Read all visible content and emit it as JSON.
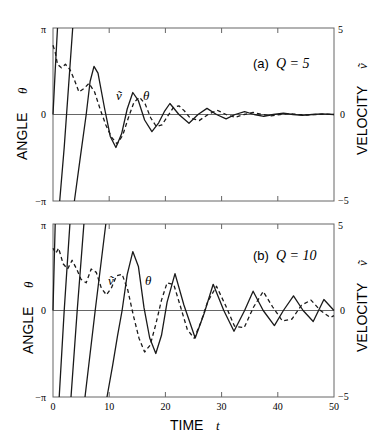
{
  "chart_data": [
    {
      "type": "line",
      "panel_label": "(a)",
      "param_label": "Q = 5",
      "Q": 5,
      "xlabel": "TIME",
      "xlabel_symbol": "t",
      "ylabel_left": "ANGLE",
      "ylabel_left_symbol": "θ",
      "ylabel_right": "VELOCITY",
      "ylabel_right_symbol": "ṽ",
      "xlim": [
        0,
        50
      ],
      "ylim_left": [
        -3.14159,
        3.14159
      ],
      "ylim_right": [
        -5,
        5
      ],
      "yticks_left": [
        "π",
        "0",
        "−π"
      ],
      "yticks_right": [
        "5",
        "0",
        "−5"
      ],
      "xticks": [
        0,
        10,
        20,
        30,
        40,
        50
      ],
      "xtick_labels_shown": false,
      "grid": false,
      "zero_line": true,
      "annotations": [
        {
          "text": "ṽ",
          "t": 12.0,
          "y": 0.95
        },
        {
          "text": "θ",
          "t": 16.5,
          "y": 0.95
        }
      ],
      "series": [
        {
          "name": "θ (angle, wrapped to [−π, π])",
          "style": "solid",
          "segments": [
            {
              "t": [
                0,
                0.4,
                0.8
              ],
              "y": [
                0,
                1.6,
                3.14
              ]
            },
            {
              "t": [
                1.2,
                2.0,
                2.8,
                3.5
              ],
              "y": [
                -3.14,
                -1.2,
                1.1,
                3.14
              ]
            },
            {
              "t": [
                3.8,
                4.9,
                5.9,
                6.6,
                7.3,
                8.0,
                9.2,
                10.2,
                11.2,
                12.2,
                13.2,
                14.2,
                15.2,
                16.3,
                17.6,
                18.8,
                19.8,
                20.8,
                22.4,
                24.2,
                25.8,
                27.4,
                29.1,
                30.8,
                32.4,
                34.1,
                35.8,
                37.5,
                39.2,
                41.0,
                42.7,
                44.4,
                46.1,
                47.8,
                50.0
              ],
              "y": [
                -3.14,
                -1.5,
                0,
                1.2,
                1.75,
                1.5,
                0.2,
                -0.8,
                -1.2,
                -0.7,
                0.2,
                0.8,
                0.5,
                -0.2,
                -0.62,
                -0.3,
                0.1,
                0.4,
                0.0,
                -0.32,
                0.0,
                0.22,
                0.0,
                -0.16,
                0.0,
                0.1,
                0.0,
                -0.07,
                0.0,
                0.05,
                0.0,
                -0.03,
                0.0,
                0.02,
                0.0
              ]
            }
          ]
        },
        {
          "name": "ṽ (velocity)",
          "style": "dashed",
          "t": [
            0,
            0.4,
            0.8,
            1.5,
            2.2,
            3.0,
            3.8,
            4.6,
            5.5,
            6.4,
            7.4,
            8.4,
            9.4,
            10.4,
            11.4,
            12.4,
            13.4,
            14.4,
            15.4,
            16.4,
            17.4,
            18.4,
            19.4,
            20.4,
            21.4,
            22.4,
            23.4,
            24.4,
            26.0,
            27.6,
            29.2,
            30.8,
            32.4,
            34.0,
            35.6,
            37.2,
            38.8,
            40.4,
            42.0,
            43.6,
            45.2,
            46.8,
            48.4,
            50.0
          ],
          "y": [
            4.0,
            3.6,
            2.9,
            2.7,
            2.9,
            2.6,
            2.0,
            1.3,
            1.5,
            1.8,
            1.3,
            0.3,
            -0.6,
            -1.3,
            -1.7,
            -1.2,
            -0.2,
            0.7,
            1.0,
            0.6,
            -0.2,
            -0.7,
            -0.6,
            -0.1,
            0.4,
            0.5,
            0.2,
            -0.2,
            -0.35,
            0.0,
            0.25,
            0.0,
            -0.17,
            0.0,
            0.12,
            0.0,
            -0.08,
            0.0,
            0.05,
            0.0,
            -0.03,
            0.0,
            0.02,
            0.0
          ]
        }
      ]
    },
    {
      "type": "line",
      "panel_label": "(b)",
      "param_label": "Q = 10",
      "Q": 10,
      "xlabel": "TIME",
      "xlabel_symbol": "t",
      "ylabel_left": "ANGLE",
      "ylabel_left_symbol": "θ",
      "ylabel_right": "VELOCITY",
      "ylabel_right_symbol": "ṽ",
      "xlim": [
        0,
        50
      ],
      "ylim_left": [
        -3.14159,
        3.14159
      ],
      "ylim_right": [
        -5,
        5
      ],
      "yticks_left": [
        "π",
        "0",
        "−π"
      ],
      "yticks_right": [
        "5",
        "0",
        "−5"
      ],
      "xticks": [
        0,
        10,
        20,
        30,
        40,
        50
      ],
      "xtick_labels_shown": true,
      "grid": false,
      "zero_line": true,
      "annotations": [
        {
          "text": "ṽ",
          "t": 10.3,
          "y": 1.6
        },
        {
          "text": "θ",
          "t": 16.4,
          "y": 1.6
        }
      ],
      "series": [
        {
          "name": "θ (angle, wrapped to [−π, π])",
          "style": "solid",
          "segments": [
            {
              "t": [
                0,
                0.2,
                0.4
              ],
              "y": [
                0,
                1.6,
                3.14
              ]
            },
            {
              "t": [
                1.1,
                2.0,
                3.0
              ],
              "y": [
                -3.14,
                0,
                3.14
              ]
            },
            {
              "t": [
                3.2,
                4.3,
                5.5
              ],
              "y": [
                -3.14,
                0,
                3.14
              ]
            },
            {
              "t": [
                5.7,
                7.5,
                9.4
              ],
              "y": [
                -3.14,
                0,
                3.14
              ]
            },
            {
              "t": [
                9.6,
                10.6,
                11.5,
                12.3,
                13.2,
                14.2,
                15.2,
                16.2,
                17.2,
                18.3,
                19.3,
                20.3,
                21.7,
                23.3,
                25.3,
                26.9,
                28.5,
                30.4,
                32.2,
                34.1,
                35.6,
                37.4,
                39.4,
                41.0,
                42.8,
                44.5,
                46.3,
                48.2,
                50.0
              ],
              "y": [
                -3.14,
                -2.0,
                -0.9,
                0.0,
                1.3,
                2.14,
                1.6,
                0.1,
                -1.0,
                -1.56,
                -0.9,
                0.3,
                1.34,
                0.2,
                -1.0,
                -0.1,
                0.95,
                0.0,
                -0.75,
                0.0,
                0.7,
                0.0,
                -0.55,
                0.0,
                0.53,
                0.0,
                -0.4,
                0.4,
                0.0
              ]
            }
          ]
        },
        {
          "name": "ṽ (velocity)",
          "style": "dashed",
          "t": [
            0,
            0.5,
            1.0,
            1.8,
            2.6,
            3.4,
            4.2,
            5.0,
            5.9,
            6.8,
            7.7,
            8.6,
            9.5,
            10.4,
            11.3,
            12.3,
            13.3,
            14.3,
            15.3,
            16.3,
            17.3,
            18.3,
            19.3,
            20.3,
            21.5,
            22.7,
            23.9,
            25.1,
            26.3,
            27.5,
            29.1,
            30.7,
            32.3,
            34.0,
            35.7,
            37.4,
            39.1,
            40.8,
            42.5,
            44.2,
            45.9,
            47.6,
            49.3,
            50.0
          ],
          "y": [
            3.6,
            3.3,
            3.6,
            2.7,
            2.4,
            2.9,
            2.4,
            1.8,
            1.6,
            2.4,
            2.2,
            1.3,
            0.9,
            1.3,
            2.0,
            2.1,
            1.2,
            -0.3,
            -1.6,
            -2.4,
            -2.0,
            -0.8,
            0.6,
            1.6,
            1.5,
            0.2,
            -1.1,
            -1.6,
            -0.7,
            0.5,
            1.4,
            0.3,
            -0.9,
            -1.0,
            0.2,
            1.1,
            0.2,
            -0.6,
            -0.5,
            0.3,
            0.6,
            0.0,
            -0.4,
            -0.3
          ]
        }
      ]
    }
  ],
  "panels": {
    "a": {
      "label": "(a)",
      "q_text": "Q = 5"
    },
    "b": {
      "label": "(b)",
      "q_text": "Q = 10"
    }
  },
  "axes": {
    "left_title": "ANGLE",
    "left_symbol": "θ",
    "right_title": "VELOCITY",
    "right_symbol": "ṽ",
    "x_title": "TIME",
    "x_symbol": "t",
    "left_ticks": {
      "top": "π",
      "mid": "0",
      "bottom": "−π"
    },
    "right_ticks": {
      "top": "5",
      "mid": "0",
      "bottom": "−5"
    },
    "x_ticks": [
      "0",
      "10",
      "20",
      "30",
      "40",
      "50"
    ]
  },
  "colors": {
    "line": "#1a1a1a",
    "axis": "#555555",
    "background": "#ffffff"
  }
}
